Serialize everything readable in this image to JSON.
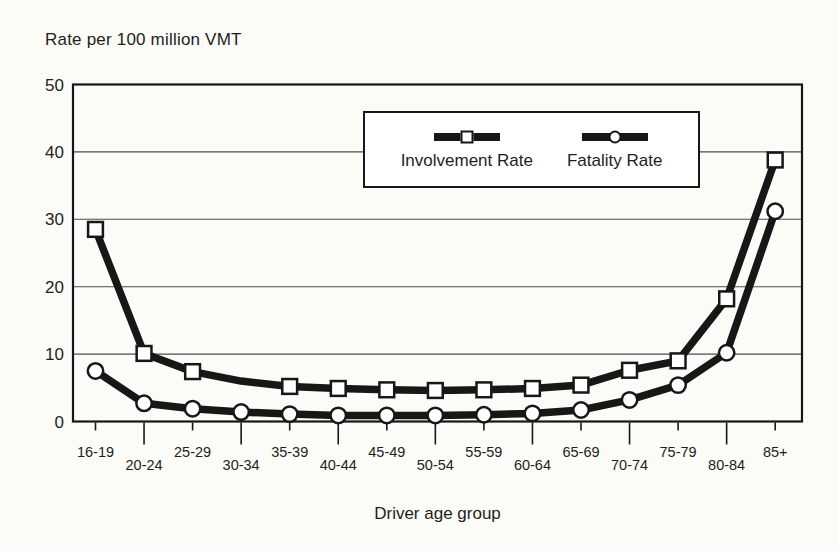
{
  "chart_data": {
    "type": "line",
    "title": "Rate per 100 million VMT",
    "xlabel": "Driver age group",
    "ylabel": "",
    "categories": [
      "16-19",
      "20-24",
      "25-29",
      "30-34",
      "35-39",
      "40-44",
      "45-49",
      "50-54",
      "55-59",
      "60-64",
      "65-69",
      "70-74",
      "75-79",
      "80-84",
      "85+"
    ],
    "series": [
      {
        "name": "Involvement Rate",
        "marker": "square",
        "values": [
          28.5,
          10.1,
          7.4,
          6.0,
          5.2,
          4.9,
          4.7,
          4.6,
          4.7,
          4.9,
          5.4,
          7.6,
          9.0,
          18.2,
          38.8
        ],
        "marker_skip_indices": [
          3
        ]
      },
      {
        "name": "Fatality Rate",
        "marker": "circle",
        "values": [
          7.5,
          2.7,
          1.9,
          1.4,
          1.1,
          0.9,
          0.9,
          0.9,
          1.0,
          1.2,
          1.7,
          3.2,
          5.4,
          10.2,
          31.2
        ],
        "marker_skip_indices": []
      }
    ],
    "ylim": [
      0,
      50
    ],
    "yticks": [
      0,
      10,
      20,
      30,
      40,
      50
    ],
    "grid": "horizontal-gridlines",
    "legend_position": "inside-top-right",
    "x_label_layout": "staggered-two-rows"
  },
  "colors": {
    "ink": "#171717",
    "grid_line": "#4d4d4d",
    "marker_fill": "#ffffff",
    "text": "#1e1e1e",
    "background": "#fbfbf8",
    "legend_background": "#ffffff"
  }
}
